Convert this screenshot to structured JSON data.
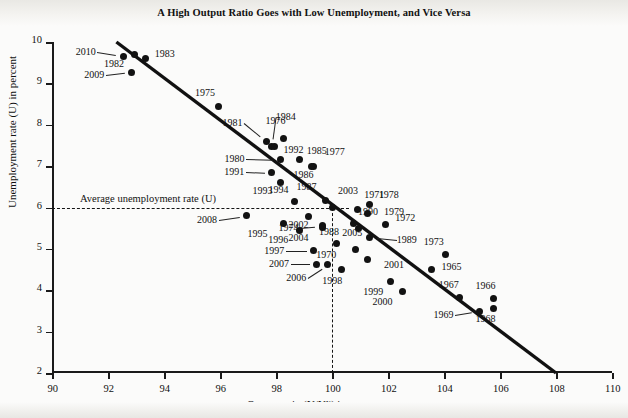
{
  "chart_data": {
    "type": "scatter",
    "title": "A High Output Ratio Goes with Low Unemployment, and Vice Versa",
    "xlabel": "Output ratio (Y/Yᴺ) in percent",
    "ylabel": "Unemployment rate (U) in percent",
    "xlim": [
      90,
      110
    ],
    "ylim": [
      2,
      10
    ],
    "xticks": [
      90,
      92,
      94,
      96,
      98,
      100,
      102,
      104,
      106,
      108,
      110
    ],
    "yticks": [
      2,
      3,
      4,
      5,
      6,
      7,
      8,
      9,
      10
    ],
    "grid": false,
    "legend": "none",
    "annotations": {
      "average_unemployment_label": "Average unemployment rate (U)",
      "average_unemployment_value": 6.0,
      "potential_output_value": 100
    },
    "trendline": {
      "label": "regression-line",
      "x": [
        92.3,
        108.0
      ],
      "y": [
        10.0,
        2.0
      ]
    },
    "series": [
      {
        "name": "Output ratio vs unemployment rate by year",
        "points": [
          {
            "label": "2010",
            "x": 92.55,
            "y": 9.66,
            "lx": -32,
            "ly": -5
          },
          {
            "label": "1982",
            "x": 92.95,
            "y": 9.69,
            "lx": -15,
            "ly": 8
          },
          {
            "label": "2009",
            "x": 92.85,
            "y": 9.27,
            "lx": -32,
            "ly": 2
          },
          {
            "label": "1983",
            "x": 93.35,
            "y": 9.59,
            "lx": 6,
            "ly": -6
          },
          {
            "label": "1975",
            "x": 95.95,
            "y": 8.45,
            "lx": -8,
            "ly": -14
          },
          {
            "label": "1984",
            "x": 97.85,
            "y": 7.48,
            "lx": 1,
            "ly": -30
          },
          {
            "label": "1981",
            "x": 97.65,
            "y": 7.6,
            "lx": -28,
            "ly": -19
          },
          {
            "label": "1976",
            "x": 98.25,
            "y": 7.67,
            "lx": -2,
            "ly": -18
          },
          {
            "label": "1992",
            "x": 97.95,
            "y": 7.48,
            "lx": 6,
            "ly": 3
          },
          {
            "label": "1980",
            "x": 98.15,
            "y": 7.16,
            "lx": -40,
            "ly": -2
          },
          {
            "label": "1985",
            "x": 98.85,
            "y": 7.16,
            "lx": 4,
            "ly": -10
          },
          {
            "label": "1977",
            "x": 99.35,
            "y": 7.0,
            "lx": 8,
            "ly": -15
          },
          {
            "label": "1986",
            "x": 99.25,
            "y": 6.99,
            "lx": -2,
            "ly": 7
          },
          {
            "label": "1991",
            "x": 97.85,
            "y": 6.84,
            "lx": -32,
            "ly": -2
          },
          {
            "label": "1993",
            "x": 98.15,
            "y": 6.61,
            "lx": -12,
            "ly": 8
          },
          {
            "label": "1994",
            "x": 98.65,
            "y": 6.14,
            "lx": -10,
            "ly": -13
          },
          {
            "label": "1987",
            "x": 99.75,
            "y": 6.18,
            "lx": -13,
            "ly": -14
          },
          {
            "label": "2003",
            "x": 100.0,
            "y": 6.0,
            "lx": 3,
            "ly": -18
          },
          {
            "label": "1971",
            "x": 100.9,
            "y": 5.95,
            "lx": 4,
            "ly": -16
          },
          {
            "label": "1990",
            "x": 100.75,
            "y": 5.62,
            "lx": 2,
            "ly": -12
          },
          {
            "label": "1978",
            "x": 101.35,
            "y": 6.07,
            "lx": 6,
            "ly": -11
          },
          {
            "label": "1979",
            "x": 101.25,
            "y": 5.85,
            "lx": 14,
            "ly": -3
          },
          {
            "label": "1972",
            "x": 101.9,
            "y": 5.6,
            "lx": 7,
            "ly": -7
          },
          {
            "label": "2002",
            "x": 99.15,
            "y": 5.78,
            "lx": -4,
            "ly": 7
          },
          {
            "label": "1974",
            "x": 99.65,
            "y": 5.56,
            "lx": -28,
            "ly": 1
          },
          {
            "label": "2008",
            "x": 96.95,
            "y": 5.8,
            "lx": -34,
            "ly": 3
          },
          {
            "label": "1995",
            "x": 98.25,
            "y": 5.62,
            "lx": -20,
            "ly": 10
          },
          {
            "label": "1996",
            "x": 98.85,
            "y": 5.45,
            "lx": -16,
            "ly": 9
          },
          {
            "label": "2004",
            "x": 99.65,
            "y": 5.52,
            "lx": -18,
            "ly": 10
          },
          {
            "label": "2005",
            "x": 100.15,
            "y": 5.12,
            "lx": 3,
            "ly": -12
          },
          {
            "label": "1988",
            "x": 100.95,
            "y": 5.5,
            "lx": -24,
            "ly": 3
          },
          {
            "label": "1989",
            "x": 101.35,
            "y": 5.28,
            "lx": 24,
            "ly": 2
          },
          {
            "label": "1997",
            "x": 99.35,
            "y": 4.96,
            "lx": -34,
            "ly": -1
          },
          {
            "label": "1970",
            "x": 100.85,
            "y": 4.98,
            "lx": -24,
            "ly": 4
          },
          {
            "label": "2007",
            "x": 99.45,
            "y": 4.63,
            "lx": -32,
            "ly": -1
          },
          {
            "label": "2006",
            "x": 99.85,
            "y": 4.62,
            "lx": -26,
            "ly": 12
          },
          {
            "label": "1998",
            "x": 100.35,
            "y": 4.5,
            "lx": -4,
            "ly": 10
          },
          {
            "label": "2001",
            "x": 101.25,
            "y": 4.75,
            "lx": 14,
            "ly": 5
          },
          {
            "label": "1999",
            "x": 102.1,
            "y": 4.22,
            "lx": -12,
            "ly": 10
          },
          {
            "label": "2000",
            "x": 102.5,
            "y": 3.98,
            "lx": -14,
            "ly": 10
          },
          {
            "label": "1973",
            "x": 104.05,
            "y": 4.86,
            "lx": -6,
            "ly": -14
          },
          {
            "label": "1965",
            "x": 103.55,
            "y": 4.51,
            "lx": 7,
            "ly": -3
          },
          {
            "label": "1967",
            "x": 104.55,
            "y": 3.83,
            "lx": -5,
            "ly": -13
          },
          {
            "label": "1969",
            "x": 105.25,
            "y": 3.49,
            "lx": -30,
            "ly": 3
          },
          {
            "label": "1966",
            "x": 105.75,
            "y": 3.79,
            "lx": -2,
            "ly": -14
          },
          {
            "label": "1968",
            "x": 105.75,
            "y": 3.55,
            "lx": -2,
            "ly": 9
          }
        ]
      }
    ]
  }
}
